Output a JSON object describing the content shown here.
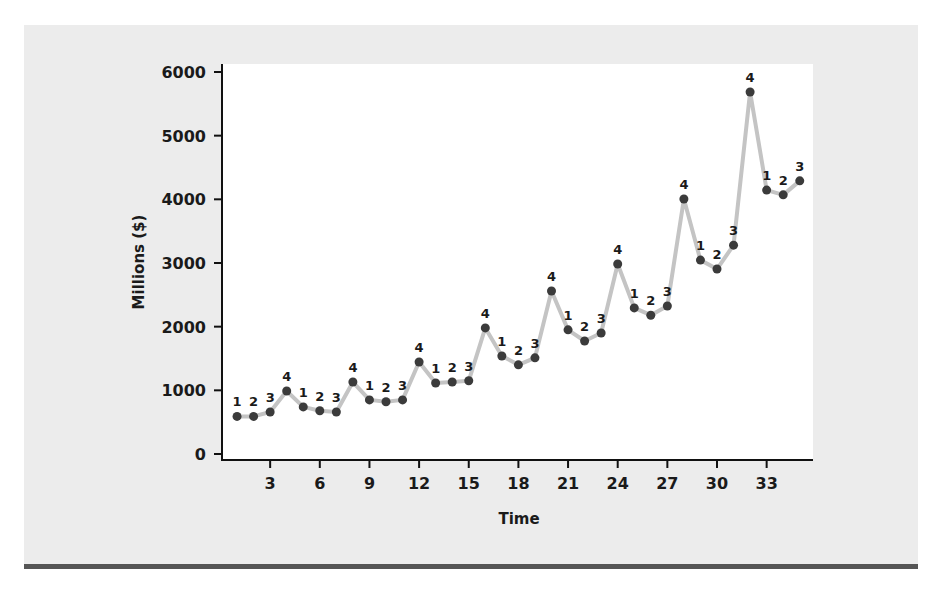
{
  "chart_data": {
    "type": "line",
    "title": "",
    "xlabel": "Time",
    "ylabel": "Millions ($)",
    "ylim": [
      0,
      6000
    ],
    "xlim": [
      0,
      35.5
    ],
    "yticks": [
      0,
      1000,
      2000,
      3000,
      4000,
      5000,
      6000
    ],
    "xticks": [
      3,
      6,
      9,
      12,
      15,
      18,
      21,
      24,
      27,
      30,
      33
    ],
    "grid": false,
    "legend": null,
    "x": [
      1,
      2,
      3,
      4,
      5,
      6,
      7,
      8,
      9,
      10,
      11,
      12,
      13,
      14,
      15,
      16,
      17,
      18,
      19,
      20,
      21,
      22,
      23,
      24,
      25,
      26,
      27,
      28,
      29,
      30,
      31,
      32,
      33,
      34,
      35
    ],
    "values": [
      590,
      590,
      660,
      990,
      740,
      680,
      660,
      1130,
      850,
      820,
      850,
      1445,
      1115,
      1130,
      1150,
      1980,
      1540,
      1400,
      1510,
      2560,
      1950,
      1775,
      1900,
      2985,
      2295,
      2180,
      2325,
      4005,
      3045,
      2905,
      3280,
      5685,
      4145,
      4070,
      4290
    ],
    "point_labels": [
      "1",
      "2",
      "3",
      "4",
      "1",
      "2",
      "3",
      "4",
      "1",
      "2",
      "3",
      "4",
      "1",
      "2",
      "3",
      "4",
      "1",
      "2",
      "3",
      "4",
      "1",
      "2",
      "3",
      "4",
      "1",
      "2",
      "3",
      "4",
      "1",
      "2",
      "3",
      "4",
      "1",
      "2",
      "3"
    ],
    "annotations": "Each point labeled with its quarter number (1-4)",
    "colors": {
      "line": "#c4c4c4",
      "marker": "#3b3b3b",
      "axis": "#111111",
      "panel": "#ececec",
      "plot_bg": "#ffffff",
      "rule": "#555555"
    }
  }
}
